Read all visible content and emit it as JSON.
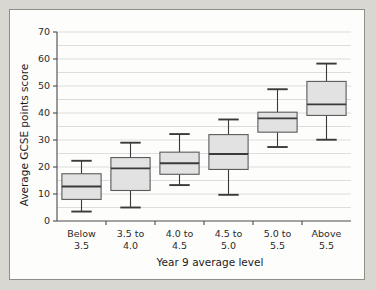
{
  "figure": {
    "background_color": "#d9d7d2",
    "panel_color": "#fdfdfc",
    "border_color": "#8e8d88"
  },
  "chart_data": {
    "type": "box",
    "title": "",
    "subtitle": "",
    "xlabel": "Year 9 average level",
    "ylabel": "Average GCSE points score",
    "ylim": [
      0,
      70
    ],
    "yticks": [
      0,
      10,
      20,
      30,
      40,
      50,
      60,
      70
    ],
    "ytick_labels": [
      "0",
      "10",
      "20",
      "30",
      "40",
      "50",
      "60",
      "70"
    ],
    "grid": true,
    "grid_minor_step": 5,
    "legend": "none",
    "box_fill_color": "#e2e2e2",
    "box_edge_color": "#5a5a5a",
    "median_color": "#3a3a3a",
    "categories": [
      "Below\n3.5",
      "3.5 to\n4.0",
      "4.0 to\n4.5",
      "4.5 to\n5.0",
      "5.0 to\n5.5",
      "Above\n5.5"
    ],
    "category_labels": [
      {
        "line1": "Below",
        "line2": "3.5"
      },
      {
        "line1": "3.5 to",
        "line2": "4.0"
      },
      {
        "line1": "4.0 to",
        "line2": "4.5"
      },
      {
        "line1": "4.5 to",
        "line2": "5.0"
      },
      {
        "line1": "5.0 to",
        "line2": "5.5"
      },
      {
        "line1": "Above",
        "line2": "5.5"
      }
    ],
    "boxes": [
      {
        "category": "Below 3.5",
        "whisker_low": 3.5,
        "q1": 8.0,
        "median": 12.8,
        "q3": 17.5,
        "whisker_high": 22.3
      },
      {
        "category": "3.5 to 4.0",
        "whisker_low": 5.0,
        "q1": 11.3,
        "median": 19.5,
        "q3": 23.5,
        "whisker_high": 29.0
      },
      {
        "category": "4.0 to 4.5",
        "whisker_low": 13.3,
        "q1": 17.3,
        "median": 21.4,
        "q3": 25.5,
        "whisker_high": 32.2
      },
      {
        "category": "4.5 to 5.0",
        "whisker_low": 9.7,
        "q1": 19.1,
        "median": 24.8,
        "q3": 32.0,
        "whisker_high": 37.6
      },
      {
        "category": "5.0 to 5.5",
        "whisker_low": 27.4,
        "q1": 32.9,
        "median": 38.0,
        "q3": 40.3,
        "whisker_high": 48.8
      },
      {
        "category": "Above 5.5",
        "whisker_low": 30.1,
        "q1": 39.1,
        "median": 43.2,
        "q3": 51.7,
        "whisker_high": 58.3
      }
    ]
  }
}
